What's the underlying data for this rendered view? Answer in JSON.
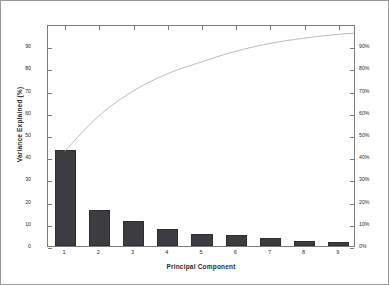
{
  "chart_data": {
    "type": "bar",
    "title": "",
    "xlabel": "Principal Component",
    "ylabel": "Variance Explained (%)",
    "categories": [
      "1",
      "2",
      "3",
      "4",
      "5",
      "6",
      "7",
      "8",
      "9"
    ],
    "values": [
      43.2,
      16.0,
      11.2,
      7.8,
      5.4,
      4.8,
      3.6,
      2.4,
      1.8
    ],
    "ylim": [
      0,
      100
    ],
    "y_ticks": [
      "0",
      "10",
      "20",
      "30",
      "40",
      "50",
      "60",
      "70",
      "80",
      "90"
    ],
    "y_tick_values": [
      0,
      10,
      20,
      30,
      40,
      50,
      60,
      70,
      80,
      90
    ],
    "right_axis_label": "",
    "right_ticks": [
      "0%",
      "10%",
      "20%",
      "30%",
      "40%",
      "50%",
      "60%",
      "70%",
      "80%",
      "90%"
    ],
    "right_tick_values": [
      0,
      10,
      20,
      30,
      40,
      50,
      60,
      70,
      80,
      90
    ],
    "right_ylim": [
      0,
      100
    ],
    "grid": false,
    "legend": "none",
    "series": [
      {
        "name": "Variance Explained",
        "type": "bar",
        "values": [
          43.2,
          16.0,
          11.2,
          7.8,
          5.4,
          4.8,
          3.6,
          2.4,
          1.8
        ],
        "color": "#3d3d3f"
      },
      {
        "name": "Cumulative Variance",
        "type": "line",
        "values": [
          43.2,
          59.2,
          70.4,
          78.2,
          83.6,
          88.4,
          92.0,
          94.4,
          96.2
        ],
        "color": "#b0b0b0"
      }
    ]
  },
  "colors": {
    "bar": "#3d3d3f",
    "bar_edge": "#2e2e30",
    "line": "#b0b0b0",
    "axis": "#7d7d7d",
    "border": "#9a9a9a",
    "text": "#2b2b2b",
    "background": "#ffffff"
  }
}
